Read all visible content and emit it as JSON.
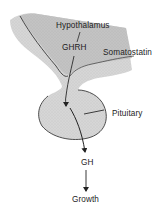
{
  "diagram": {
    "type": "anatomical-flow",
    "labels": {
      "hypothalamus": "Hypothalamus",
      "ghrh": "GHRH",
      "somatostatin": "Somatostatin",
      "pituitary": "Pituitary",
      "gh": "GH",
      "growth": "Growth"
    },
    "structures": [
      {
        "id": "hypothalamus",
        "label": "Hypothalamus"
      },
      {
        "id": "pituitary",
        "label": "Pituitary"
      }
    ],
    "flow": [
      {
        "from": "Hypothalamus",
        "via": "GHRH",
        "to": "Pituitary"
      },
      {
        "from": "Hypothalamus",
        "via": "Somatostatin",
        "to": "Pituitary"
      },
      {
        "from": "Pituitary",
        "to": "GH"
      },
      {
        "from": "GH",
        "to": "Growth"
      }
    ],
    "colors": {
      "tissue_fill": "#d4d4d4",
      "tissue_dark": "#bdbdbd",
      "outline": "#3a3a3a",
      "text": "#1c1c1c",
      "background": "#ffffff"
    }
  }
}
